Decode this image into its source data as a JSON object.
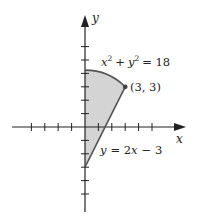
{
  "diagram": {
    "type": "region-bounded-by-curves",
    "origin_px": [
      85,
      127
    ],
    "unit_px": 13.4,
    "colors": {
      "axis": "#222222",
      "curve": "#555555",
      "fill": "#d4d4d4",
      "point": "#444444"
    },
    "axes": {
      "x_label": "x",
      "y_label": "y",
      "x_ticks": [
        -4,
        -3,
        -2,
        -1,
        1,
        2,
        3,
        4,
        5
      ],
      "y_ticks": [
        -5,
        -4,
        -3,
        -2,
        -1,
        1,
        2,
        3,
        4,
        5,
        6
      ]
    },
    "curves": [
      {
        "name": "circle",
        "label": "x² + y² = 18",
        "equation": "x^2 + y^2 = 18"
      },
      {
        "name": "line",
        "label": "y = 2x − 3",
        "equation": "y = 2x - 3"
      }
    ],
    "point": {
      "label": "(3, 3)",
      "x": 3,
      "y": 3
    },
    "labels": {
      "circle_eq_x": "x",
      "circle_eq_sup1": "2",
      "circle_eq_plus": "+",
      "circle_eq_y": "y",
      "circle_eq_sup2": "2",
      "circle_eq_rhs": "= 18",
      "line_eq_y": "y",
      "line_eq_rhs": "= 2",
      "line_eq_x": "x",
      "line_eq_tail": "− 3",
      "point_label": "(3, 3)"
    }
  }
}
